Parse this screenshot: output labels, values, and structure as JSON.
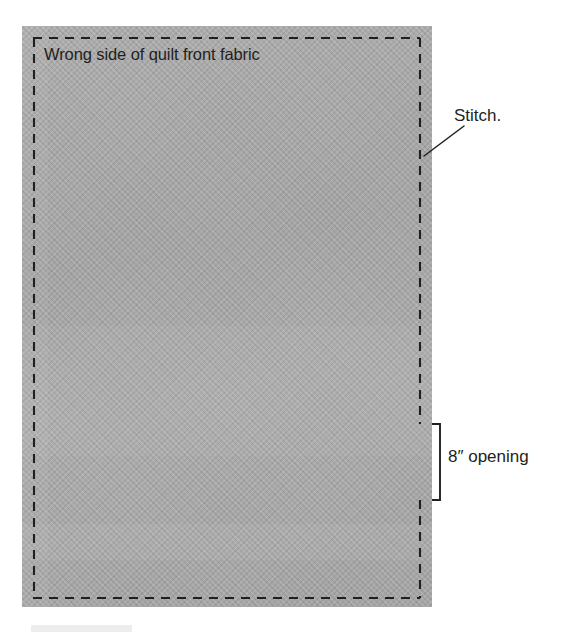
{
  "figure": {
    "title_label": "Wrong side of quilt front fabric",
    "callouts": [
      {
        "id": "stitch",
        "label": "Stitch."
      },
      {
        "id": "opening",
        "label": "8″ opening"
      }
    ],
    "colors": {
      "fabric": "#a9a9a9",
      "stitch_line": "#231f20",
      "text": "#231f20",
      "background": "#ffffff",
      "bottom_bar": "#ededed"
    },
    "stitch_line": {
      "style": "dashed",
      "dash_length_px": 9,
      "gap_length_px": 7,
      "thickness_px": 2
    }
  }
}
